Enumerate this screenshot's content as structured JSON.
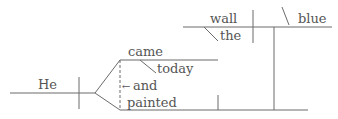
{
  "diagram": {
    "type": "sentence-diagram",
    "line_color": "#6b6b6b",
    "text_color": "#555555",
    "words": {
      "subject": "He",
      "verb1": "came",
      "modifier1": "today",
      "conjunction": "and",
      "verb2": "painted",
      "object": "wall",
      "article": "the",
      "complement": "blue"
    },
    "arrow": "←"
  }
}
